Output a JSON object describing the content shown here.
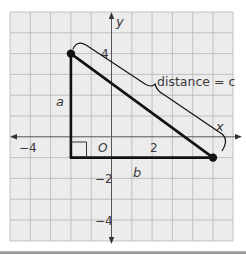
{
  "diagram": {
    "type": "coordinate-grid-right-triangle",
    "axes": {
      "x_label": "x",
      "y_label": "y",
      "origin_label": "O",
      "x_tick_labels": [
        {
          "value": -4,
          "text": "−4"
        },
        {
          "value": 2,
          "text": "2"
        }
      ],
      "y_tick_labels": [
        {
          "value": 4,
          "text": "4"
        },
        {
          "value": -2,
          "text": "−2"
        },
        {
          "value": -4,
          "text": "−4"
        }
      ],
      "x_range": [
        -5,
        6
      ],
      "y_range": [
        -5,
        6
      ]
    },
    "points": [
      {
        "name": "top-vertex",
        "x": -2,
        "y": 4
      },
      {
        "name": "right-vertex",
        "x": 5,
        "y": -1
      },
      {
        "name": "right-angle-vertex",
        "x": -2,
        "y": -1
      }
    ],
    "labels": {
      "leg_vertical": "a",
      "leg_horizontal": "b",
      "hypotenuse": "distance = c"
    },
    "colors": {
      "grid_bg": "#ececec",
      "grid_line": "#b5b5b5",
      "axis": "#555555",
      "triangle": "#111111",
      "label_text": "#3a3a3a"
    }
  }
}
